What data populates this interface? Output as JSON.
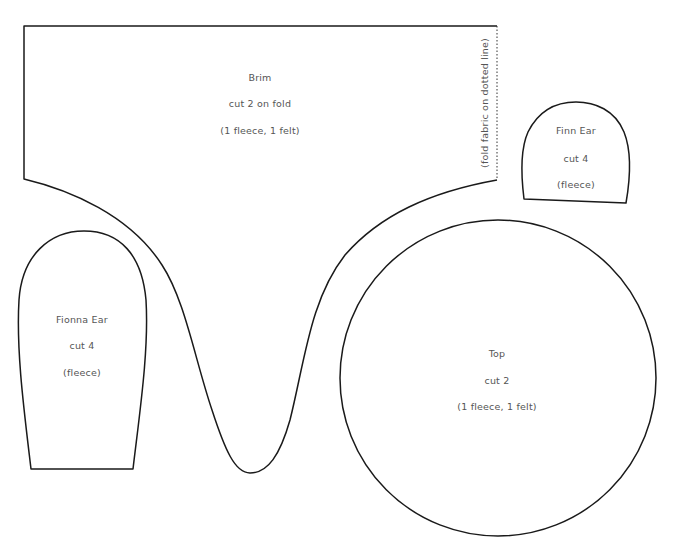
{
  "pieces": {
    "brim": {
      "name": "Brim",
      "cut": "cut 2 on fold",
      "material": "(1 fleece, 1 felt)",
      "fold_note": "(fold fabric on dotted line)"
    },
    "finn_ear": {
      "name": "Finn Ear",
      "cut": "cut 4",
      "material": "(fleece)"
    },
    "fionna_ear": {
      "name": "Fionna Ear",
      "cut": "cut 4",
      "material": "(fleece)"
    },
    "top": {
      "name": "Top",
      "cut": "cut 2",
      "material": "(1 fleece, 1 felt)"
    }
  },
  "colors": {
    "outline": "#1a1a1a",
    "text": "#555555",
    "background": "#ffffff"
  }
}
